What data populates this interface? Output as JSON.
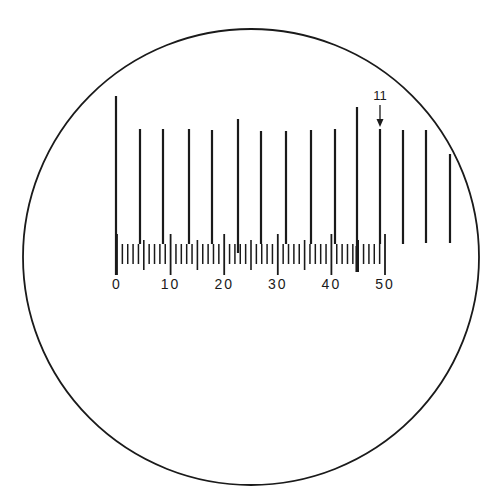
{
  "figure": {
    "ink_color": "#1a1a1a",
    "background": "#ffffff"
  },
  "field_of_view": {
    "cx": 251,
    "cy": 257,
    "r": 228
  },
  "scale": {
    "x0": 117,
    "px_per_unit": 5.36,
    "min": 0,
    "max": 50,
    "minor_top": 244,
    "minor_bottom": 264,
    "half_top": 240,
    "half_bottom": 270,
    "major_top": 234,
    "major_bottom": 275,
    "label_y": 289,
    "labels": [
      "0",
      "10",
      "20",
      "30",
      "40",
      "50"
    ],
    "label_values": [
      0,
      10,
      20,
      30,
      40,
      50
    ]
  },
  "long_lines": [
    {
      "x": 116,
      "top": 96,
      "bottom": 275
    },
    {
      "x": 140,
      "top": 129,
      "bottom": 244
    },
    {
      "x": 163,
      "top": 129,
      "bottom": 244
    },
    {
      "x": 189,
      "top": 129,
      "bottom": 244
    },
    {
      "x": 212,
      "top": 130,
      "bottom": 244
    },
    {
      "x": 238,
      "top": 119,
      "bottom": 253
    },
    {
      "x": 261,
      "top": 131,
      "bottom": 244
    },
    {
      "x": 286,
      "top": 131,
      "bottom": 244
    },
    {
      "x": 311,
      "top": 130,
      "bottom": 244
    },
    {
      "x": 335,
      "top": 129,
      "bottom": 244
    },
    {
      "x": 357,
      "top": 107,
      "bottom": 272
    },
    {
      "x": 380,
      "top": 129,
      "bottom": 244
    },
    {
      "x": 403,
      "top": 130,
      "bottom": 244
    },
    {
      "x": 426,
      "top": 130,
      "bottom": 243
    },
    {
      "x": 450,
      "top": 154,
      "bottom": 243
    }
  ],
  "annotation": {
    "label": "11",
    "x": 380,
    "label_y": 100,
    "arrow_from_y": 105,
    "arrow_to_y": 127
  }
}
